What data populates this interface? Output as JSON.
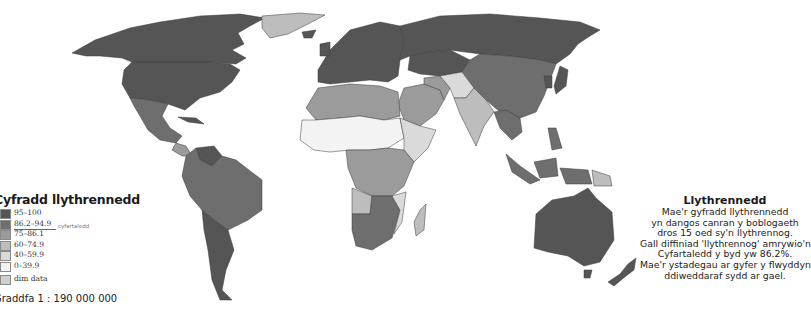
{
  "legend": {
    "title": "Cyfradd llythrennedd",
    "colors": {
      "c95_100": "#555555",
      "c86_95": "#6e6e6e",
      "c75_86": "#9b9b9b",
      "c60_75": "#bdbdbd",
      "c40_60": "#dadada",
      "c0_40": "#f3f3f3",
      "nodata": "#cfcfcf"
    },
    "items": [
      {
        "label": "95–100",
        "color": "#555555"
      },
      {
        "label": "86.2–94.9",
        "color": "#6e6e6e"
      },
      {
        "label": "75–86.1",
        "color": "#9b9b9b"
      },
      {
        "label": "60–74.9",
        "color": "#bdbdbd"
      },
      {
        "label": "40–59.9",
        "color": "#dadada"
      },
      {
        "label": "0–39.9",
        "color": "#f3f3f3"
      }
    ],
    "average_label": "cyfartaledd",
    "no_data": {
      "label": "dim data",
      "color": "#cfcfcf"
    },
    "scale": "Graddfa 1 : 190 000 000"
  },
  "note": {
    "title": "Llythrennedd",
    "lines": [
      "Mae'r gyfradd llythrennedd",
      "yn dangos canran y boblogaeth",
      "dros 15 oed sy'n llythrennog.",
      "Gall diffiniad 'llythrennog' amrywio'n fawr.",
      "Cyfartaledd y byd yw 86.2%.",
      "Mae'r ystadegau ar gyfer y flwyddyn",
      "ddiweddaraf sydd ar gael."
    ]
  },
  "map": {
    "subject": "World literacy rate choropleth",
    "world_average_percent": 86.2
  }
}
